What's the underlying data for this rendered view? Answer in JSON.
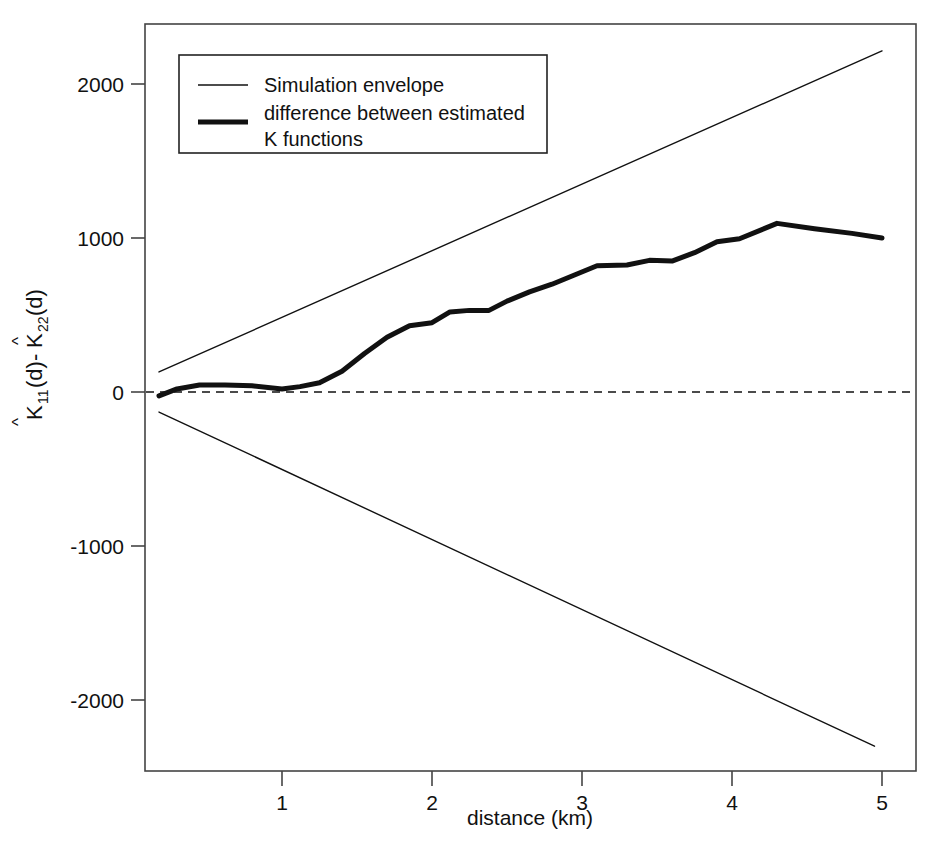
{
  "chart_data": {
    "type": "line",
    "title": "",
    "xlabel": "distance (km)",
    "ylabel": "K11(d)-K22(d)",
    "ylabel_parts": {
      "k1": "K",
      "sub1": "11",
      "mid": "(d)-",
      "k2": "K",
      "sub2": "22",
      "tail": "(d)",
      "hat": "^"
    },
    "xlim": [
      0.15,
      5.15
    ],
    "ylim": [
      -2450,
      2450
    ],
    "xticks": [
      1,
      2,
      3,
      4,
      5
    ],
    "xticklabels": [
      "1",
      "2",
      "3",
      "4",
      "5"
    ],
    "yticks": [
      -2000,
      -1000,
      0,
      1000,
      2000
    ],
    "yticklabels": [
      "-2000",
      "-1000",
      "0",
      "1000",
      "2000"
    ],
    "grid": false,
    "zero_reference_line": {
      "value": 0,
      "style": "dashed",
      "color": "#111111"
    },
    "legend": {
      "position": "top-left",
      "entries": [
        {
          "label": "Simulation envelope",
          "style": "thin-line",
          "width": 1.2,
          "color": "#111111"
        },
        {
          "label": "difference between estimated\nK functions",
          "label_line1": "difference between estimated",
          "label_line2": "K functions",
          "style": "thick-line",
          "width": 5,
          "color": "#111111"
        }
      ]
    },
    "series": [
      {
        "name": "Simulation envelope (upper)",
        "style": "thin-line",
        "color": "#111111",
        "x": [
          0.18,
          5.0
        ],
        "values": [
          130,
          2215
        ]
      },
      {
        "name": "Simulation envelope (lower)",
        "style": "thin-line",
        "color": "#111111",
        "x": [
          0.18,
          4.95
        ],
        "values": [
          -130,
          -2300
        ]
      },
      {
        "name": "difference between estimated K functions",
        "style": "thick-line",
        "color": "#111111",
        "x": [
          0.18,
          0.3,
          0.45,
          0.62,
          0.8,
          1.0,
          1.12,
          1.25,
          1.4,
          1.55,
          1.7,
          1.85,
          2.0,
          2.12,
          2.25,
          2.38,
          2.5,
          2.65,
          2.8,
          2.95,
          3.1,
          3.3,
          3.45,
          3.6,
          3.75,
          3.9,
          4.05,
          4.3,
          4.55,
          4.8,
          5.0
        ],
        "values": [
          -25,
          20,
          45,
          45,
          40,
          20,
          35,
          60,
          135,
          250,
          355,
          430,
          450,
          520,
          530,
          530,
          590,
          650,
          700,
          760,
          820,
          825,
          855,
          850,
          905,
          975,
          995,
          1095,
          1060,
          1030,
          1000
        ]
      }
    ]
  }
}
